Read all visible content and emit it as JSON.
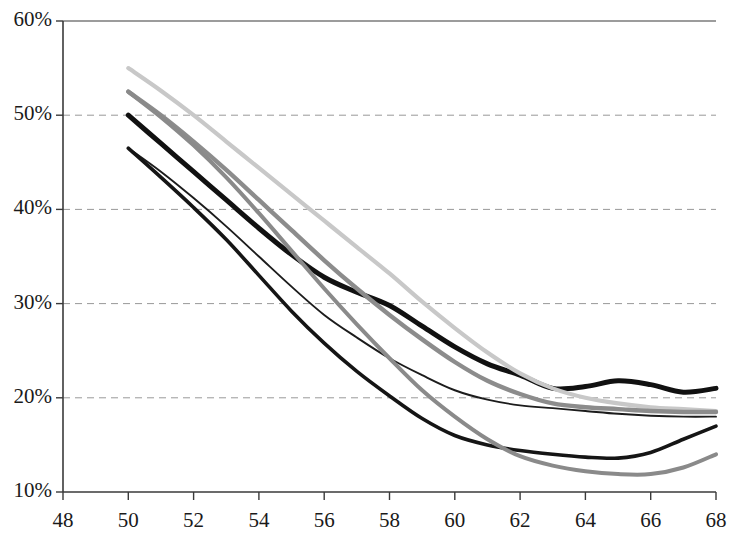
{
  "chart_data": {
    "type": "line",
    "title": "",
    "subtitle": "",
    "xlabel": "",
    "ylabel": "",
    "xlim": [
      48,
      68
    ],
    "ylim": [
      10,
      60
    ],
    "xticks": [
      48,
      50,
      52,
      54,
      56,
      58,
      60,
      62,
      64,
      66,
      68
    ],
    "xtick_labels": [
      "48",
      "50",
      "52",
      "54",
      "56",
      "58",
      "60",
      "62",
      "64",
      "66",
      "68"
    ],
    "yticks": [
      10,
      20,
      30,
      40,
      50,
      60
    ],
    "ytick_labels": [
      "10%",
      "20%",
      "30%",
      "40%",
      "50%",
      "60%"
    ],
    "grid": {
      "horizontal": true,
      "vertical": false,
      "style": "dashed",
      "color": "#999999"
    },
    "legend": {
      "visible": false,
      "position": "none"
    },
    "axis_color": "#3a3a3a",
    "background": "#ffffff",
    "x": [
      50,
      51,
      52,
      53,
      54,
      55,
      56,
      57,
      58,
      59,
      60,
      61,
      62,
      63,
      64,
      65,
      66,
      67,
      68
    ],
    "series": [
      {
        "name": "series-1-thick-black",
        "color": "#111111",
        "width": 5.0,
        "values": [
          50.0,
          47.0,
          44.0,
          41.0,
          38.0,
          35.2,
          32.8,
          31.2,
          29.8,
          27.6,
          25.4,
          23.6,
          22.4,
          21.0,
          21.2,
          21.8,
          21.4,
          20.6,
          21.0
        ]
      },
      {
        "name": "series-2-light-gray",
        "color": "#c8c8c8",
        "width": 4.2,
        "values": [
          55.0,
          52.6,
          50.0,
          47.2,
          44.4,
          41.6,
          38.8,
          36.0,
          33.2,
          30.2,
          27.4,
          24.8,
          22.6,
          21.0,
          20.0,
          19.4,
          19.0,
          18.8,
          18.6
        ]
      },
      {
        "name": "series-3-medium-gray",
        "color": "#8c8c8c",
        "width": 4.4,
        "values": [
          52.5,
          50.0,
          47.2,
          44.2,
          41.0,
          37.8,
          34.6,
          31.6,
          28.8,
          26.2,
          23.8,
          21.8,
          20.4,
          19.4,
          19.0,
          18.8,
          18.6,
          18.5,
          18.5
        ]
      },
      {
        "name": "series-4-thin-black",
        "color": "#1c1c1c",
        "width": 1.9,
        "values": [
          46.5,
          44.0,
          41.2,
          38.2,
          35.0,
          31.8,
          28.8,
          26.4,
          24.2,
          22.4,
          20.8,
          19.8,
          19.2,
          18.9,
          18.6,
          18.3,
          18.1,
          18.0,
          18.0
        ]
      },
      {
        "name": "series-5-dark-lower",
        "color": "#151515",
        "width": 3.6,
        "values": [
          46.5,
          43.4,
          40.2,
          36.8,
          33.0,
          29.2,
          25.8,
          22.8,
          20.2,
          17.8,
          16.0,
          15.0,
          14.4,
          14.0,
          13.7,
          13.6,
          14.2,
          15.6,
          17.0
        ]
      },
      {
        "name": "series-6-gray-lowest",
        "color": "#8a8a8a",
        "width": 4.0,
        "values": [
          52.5,
          49.8,
          46.8,
          43.4,
          39.6,
          35.6,
          31.6,
          27.8,
          24.2,
          20.8,
          18.0,
          15.6,
          13.8,
          12.8,
          12.2,
          11.9,
          11.9,
          12.6,
          14.0
        ]
      }
    ]
  }
}
